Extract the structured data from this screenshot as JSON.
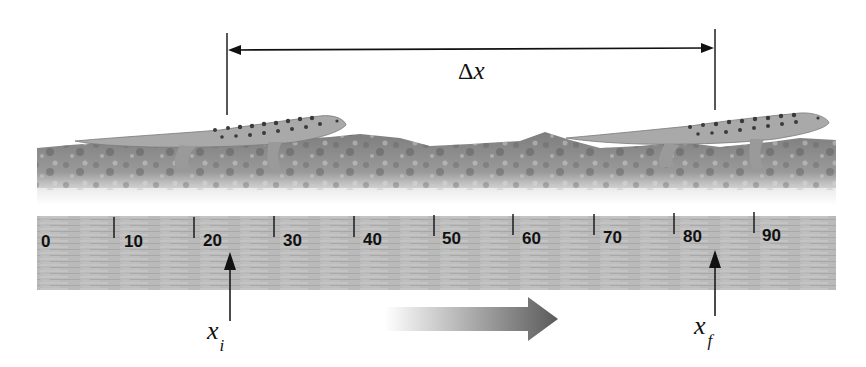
{
  "figure": {
    "displacement_label": {
      "symbol": "Δ",
      "variable": "x"
    },
    "initial_position": {
      "variable": "x",
      "subscript": "i",
      "scale_value": 22
    },
    "final_position": {
      "variable": "x",
      "subscript": "f",
      "scale_value": 84
    },
    "direction_arrow": {
      "direction": "right",
      "meaning": "direction of motion"
    },
    "subjects": [
      "gecko-initial",
      "gecko-final"
    ]
  },
  "ruler": {
    "tick_labels": [
      "0",
      "10",
      "20",
      "30",
      "40",
      "50",
      "60",
      "70",
      "80",
      "90"
    ],
    "tick_values": [
      0,
      10,
      20,
      30,
      40,
      50,
      60,
      70,
      80,
      90
    ]
  },
  "colors": {
    "ruler": "#b9b9b9",
    "rock": "#8a8a8a",
    "gecko": "#a8a8a8",
    "gecko_spots": "#3a3a3a",
    "line": "#111111",
    "arrow_dark": "#555555"
  }
}
